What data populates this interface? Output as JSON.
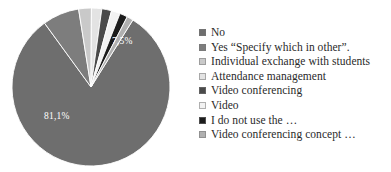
{
  "chart_data": {
    "type": "pie",
    "title": "",
    "labels": [
      "No",
      "Yes “Specify which in other”.",
      "Individual exchange with students",
      "Attendance management",
      "Video conferencing",
      "Video",
      "I do not use the …",
      "Video conferencing concept …"
    ],
    "values": [
      81.1,
      7.5,
      2.6,
      2.1,
      2.0,
      1.8,
      1.6,
      1.3
    ],
    "value_labels": [
      "81,1%",
      "7,5%",
      "",
      "",
      "",
      "",
      "",
      ""
    ],
    "shown_value_labels": [
      "81,1%",
      "7,5%"
    ],
    "colors": [
      "#6e6e6e",
      "#7d7d7d",
      "#c9c9c9",
      "#e3e3e3",
      "#4a4a4a",
      "#f2f2f2",
      "#1c1c1c",
      "#b0b0b0"
    ],
    "legend_position": "right",
    "grid": false,
    "start_angle_deg": -58,
    "direction": "clockwise",
    "label_81": "81,1%",
    "label_75": "7,5%"
  },
  "legend": {
    "items": [
      {
        "label": "No",
        "color": "#6e6e6e"
      },
      {
        "label": "Yes “Specify which in other”.",
        "color": "#7d7d7d"
      },
      {
        "label": "Individual exchange with students",
        "color": "#c9c9c9"
      },
      {
        "label": "Attendance management",
        "color": "#e3e3e3"
      },
      {
        "label": "Video conferencing",
        "color": "#4a4a4a"
      },
      {
        "label": "Video",
        "color": "#f2f2f2"
      },
      {
        "label": "I do not use the …",
        "color": "#1c1c1c"
      },
      {
        "label": "Video conferencing concept …",
        "color": "#b0b0b0"
      }
    ]
  }
}
